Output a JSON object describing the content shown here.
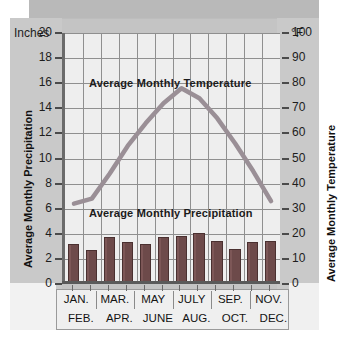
{
  "chart_data": {
    "type": "bar",
    "title": "",
    "categories": [
      "JAN.",
      "FEB.",
      "MAR.",
      "APR.",
      "MAY",
      "JUNE",
      "JULY",
      "AUG.",
      "SEP.",
      "OCT.",
      "NOV.",
      "DEC."
    ],
    "month_labels_top": [
      "JAN.",
      "MAR.",
      "MAY",
      "JULY",
      "SEP.",
      "NOV."
    ],
    "month_labels_bottom": [
      "FEB.",
      "APR.",
      "JUNE",
      "AUG.",
      "OCT.",
      "DEC."
    ],
    "series": [
      {
        "name": "Average Monthly Precipitation",
        "type": "bar",
        "unit": "Inches",
        "axis": "left",
        "values": [
          3.2,
          2.7,
          3.75,
          3.35,
          3.2,
          3.75,
          3.8,
          4.1,
          3.4,
          2.8,
          3.35,
          3.45
        ]
      },
      {
        "name": "Average Monthly Temperature",
        "type": "line",
        "unit": "°F",
        "axis": "right",
        "values": [
          32,
          34,
          44,
          55,
          64,
          72,
          78,
          74,
          66,
          56,
          45,
          33
        ]
      }
    ],
    "left_axis": {
      "label": "Average Monthly Precipitation",
      "unit": "Inches",
      "ylim": [
        0,
        20
      ],
      "ticks": [
        20,
        18,
        16,
        14,
        12,
        10,
        8,
        6,
        4,
        2,
        0
      ]
    },
    "right_axis": {
      "label": "Average Monthly Temperature",
      "unit": "°F",
      "ylim": [
        0,
        100
      ],
      "ticks": [
        100,
        90,
        80,
        70,
        60,
        50,
        40,
        30,
        20,
        10,
        0
      ]
    },
    "xlabel": "",
    "grid": true,
    "legend_position": "inline-annotations",
    "annotations": [
      {
        "text": "Average Monthly Temperature",
        "position": "upper-center"
      },
      {
        "text": "Average Monthly Precipitation",
        "position": "lower-center"
      }
    ],
    "colors": {
      "bar": "#6d4a4a",
      "bar_border": "#4a3030",
      "line": "#9a8f96",
      "plot_background": "#eeeeee",
      "grid": "#8f8f8f",
      "axis": "#5a5a5a",
      "frame_background": "#c4c4c4",
      "text": "#1b1b1b"
    }
  }
}
